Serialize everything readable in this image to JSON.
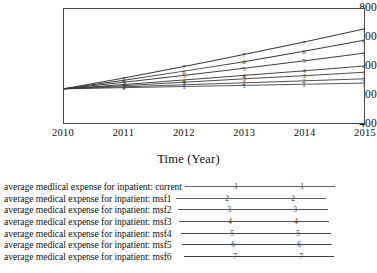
{
  "chart_data": {
    "type": "line",
    "title": "",
    "xlabel": "Time (Year)",
    "ylabel": "",
    "x": [
      2010,
      2011,
      2012,
      2013,
      2014,
      2015
    ],
    "xlim": [
      2010,
      2015
    ],
    "ylim": [
      400,
      800
    ],
    "xticks": [
      "2010",
      "2011",
      "2012",
      "2013",
      "2014",
      "2015"
    ],
    "yticks": [
      "400",
      "500",
      "600",
      "700",
      "800"
    ],
    "grid": false,
    "legend_position": "below",
    "marker_style": "series-number",
    "series": [
      {
        "name": "average medlical expense for inpatient: current",
        "key": "1",
        "values": [
          520,
          524,
          528,
          532,
          536,
          540
        ]
      },
      {
        "name": "average medical expense for inpatient: msf1",
        "key": "2",
        "values": [
          520,
          527,
          534,
          541,
          548,
          555
        ]
      },
      {
        "name": "average medical expense for inpatient: msf2",
        "key": "3",
        "values": [
          520,
          531,
          543,
          555,
          566,
          578
        ]
      },
      {
        "name": "average medical expense for inpatient: msf3",
        "key": "4",
        "values": [
          520,
          535,
          551,
          567,
          583,
          600
        ]
      },
      {
        "name": "average medical expense for inpatient: msf4",
        "key": "5",
        "values": [
          520,
          543,
          567,
          592,
          618,
          645
        ]
      },
      {
        "name": "average medical expense for inpatient: msf5",
        "key": "6",
        "values": [
          520,
          550,
          582,
          615,
          652,
          690
        ]
      },
      {
        "name": "average medical expense for inpatient: msf6",
        "key": "7",
        "values": [
          520,
          558,
          598,
          640,
          684,
          730
        ]
      }
    ]
  },
  "axis": {
    "xtitle": "Time (Year)",
    "yticks": [
      {
        "label": "800",
        "value": 800
      },
      {
        "label": "700",
        "value": 700
      },
      {
        "label": "600",
        "value": 600
      },
      {
        "label": "500",
        "value": 500
      },
      {
        "label": "400",
        "value": 400
      }
    ],
    "xticks": [
      {
        "label": "2010",
        "value": 2010
      },
      {
        "label": "2011",
        "value": 2011
      },
      {
        "label": "2012",
        "value": 2012
      },
      {
        "label": "2013",
        "value": 2013
      },
      {
        "label": "2014",
        "value": 2014
      },
      {
        "label": "2015",
        "value": 2015
      }
    ]
  },
  "legend": {
    "rows": [
      {
        "label": "average medlical expense for inpatient: current",
        "key": "1"
      },
      {
        "label": "average medical expense for inpatient: msf1",
        "key": "2"
      },
      {
        "label": "average medical expense for inpatient: msf2",
        "key": "3"
      },
      {
        "label": "average medical expense for inpatient: msf3",
        "key": "4"
      },
      {
        "label": "average medical expense for inpatient: msf4",
        "key": "5"
      },
      {
        "label": "average medical expense for inpatient: msf5",
        "key": "6"
      },
      {
        "label": "average medical expense for inpatient: msf6",
        "key": "7"
      }
    ]
  },
  "colors": {
    "line": "#3a3a3a",
    "frame": "#4a4a4a",
    "text": "#111111",
    "background": "#ffffff"
  }
}
